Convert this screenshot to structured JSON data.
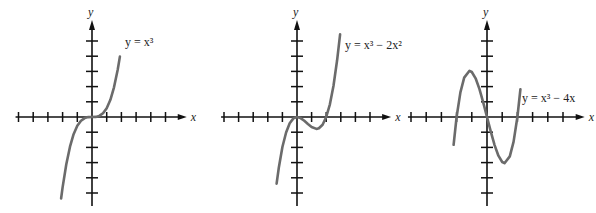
{
  "chart_data": [
    {
      "type": "line",
      "title": "y = x^3",
      "label": "y = x³",
      "xlabel": "x",
      "ylabel": "y",
      "xlim": [
        -5,
        5
      ],
      "x_ticks": [
        -5,
        -4,
        -3,
        -2,
        -1,
        1,
        2,
        3,
        4,
        5
      ],
      "y_ticks_above": 5,
      "y_ticks_below": 5,
      "points": [
        [
          -2.1,
          -9.26
        ],
        [
          -2,
          -8
        ],
        [
          -1.75,
          -5.36
        ],
        [
          -1.5,
          -3.38
        ],
        [
          -1.25,
          -1.95
        ],
        [
          -1,
          -1
        ],
        [
          -0.75,
          -0.42
        ],
        [
          -0.5,
          -0.125
        ],
        [
          -0.25,
          -0.016
        ],
        [
          0,
          0
        ],
        [
          0.25,
          0.016
        ],
        [
          0.5,
          0.125
        ],
        [
          0.75,
          0.42
        ],
        [
          1,
          1
        ],
        [
          1.25,
          1.95
        ],
        [
          1.5,
          3.38
        ],
        [
          1.75,
          5.36
        ],
        [
          1.9,
          6.86
        ]
      ],
      "origin_px": [
        92,
        117
      ],
      "x_unit_px": 14.7,
      "y_unit_px": 8.8,
      "ymax_px": 79,
      "ymin_px": -81,
      "label_pos": [
        125,
        46
      ]
    },
    {
      "type": "line",
      "title": "y = x^3 - 2x^2",
      "label": "y = x³ − 2x²",
      "xlabel": "x",
      "ylabel": "y",
      "xlim": [
        -5,
        5
      ],
      "points": [
        [
          -1.4,
          -6.66
        ],
        [
          -1.25,
          -5.08
        ],
        [
          -1,
          -3
        ],
        [
          -0.75,
          -1.55
        ],
        [
          -0.5,
          -0.625
        ],
        [
          -0.25,
          -0.14
        ],
        [
          0,
          0
        ],
        [
          0.25,
          -0.11
        ],
        [
          0.5,
          -0.375
        ],
        [
          0.75,
          -0.7
        ],
        [
          1,
          -1
        ],
        [
          1.33,
          -1.19
        ],
        [
          1.5,
          -1.125
        ],
        [
          1.75,
          -0.77
        ],
        [
          2,
          0
        ],
        [
          2.25,
          1.27
        ],
        [
          2.5,
          3.13
        ],
        [
          2.75,
          5.67
        ],
        [
          2.95,
          8.26
        ]
      ],
      "origin_px": [
        297,
        117
      ],
      "x_unit_px": 14.6,
      "y_unit_px": 10.0,
      "label_pos": [
        345,
        49
      ]
    },
    {
      "type": "line",
      "title": "y = x^3 - 4x",
      "label": "y = x³ − 4x",
      "xlabel": "x",
      "ylabel": "y",
      "xlim": [
        -5,
        5
      ],
      "points": [
        [
          -2.2,
          -1.85
        ],
        [
          -2,
          0
        ],
        [
          -1.75,
          1.64
        ],
        [
          -1.5,
          2.63
        ],
        [
          -1.15,
          3.08
        ],
        [
          -1,
          3
        ],
        [
          -0.75,
          2.58
        ],
        [
          -0.5,
          1.875
        ],
        [
          -0.25,
          0.98
        ],
        [
          0,
          0
        ],
        [
          0.25,
          -0.98
        ],
        [
          0.5,
          -1.875
        ],
        [
          0.75,
          -2.58
        ],
        [
          1,
          -3
        ],
        [
          1.15,
          -3.08
        ],
        [
          1.5,
          -2.63
        ],
        [
          1.75,
          -1.64
        ],
        [
          2,
          0
        ],
        [
          2.2,
          1.85
        ]
      ],
      "origin_px": [
        487,
        117
      ],
      "x_unit_px": 15.2,
      "y_unit_px": 15.0,
      "label_pos": [
        522,
        102
      ]
    }
  ],
  "graphs": [
    {
      "y_axis_label": "y",
      "x_axis_label": "x",
      "equation_label": "y = x³"
    },
    {
      "y_axis_label": "y",
      "x_axis_label": "x",
      "equation_label": "y = x³ − 2x²"
    },
    {
      "y_axis_label": "y",
      "x_axis_label": "x",
      "equation_label": "y = x³ − 4x"
    }
  ],
  "colors": {
    "axis": "#111111",
    "curve": "#6b6b6b",
    "text": "#222222"
  }
}
